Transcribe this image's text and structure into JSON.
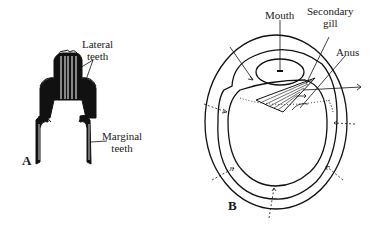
{
  "figure_a": {
    "panel_label": "A",
    "labels": {
      "lateral_line1": "Lateral",
      "lateral_line2": "teeth",
      "marginal_line1": "Marginal",
      "marginal_line2": "teeth"
    }
  },
  "figure_b": {
    "panel_label": "B",
    "labels": {
      "mouth": "Mouth",
      "secondary_line1": "Secondary",
      "secondary_line2": "gill",
      "anus": "Anus"
    }
  }
}
